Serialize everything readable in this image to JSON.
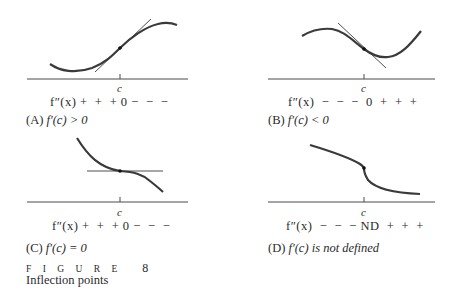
{
  "figure": {
    "number_label": "F I G U R E",
    "number": "8",
    "title": "Inflection points"
  },
  "panels": [
    {
      "id": "A",
      "tick_label": "c",
      "sign_chart": "f″(x) +  +  + 0 −  −  −",
      "caption_prefix": "(A) ",
      "caption": "f′(c) > 0",
      "tangent": "sloped-positive",
      "concavity_change": "up-to-down"
    },
    {
      "id": "B",
      "tick_label": "c",
      "sign_chart": "f″(x)  −  −  −  0  +  +  +",
      "caption_prefix": "(B) ",
      "caption": "f′(c) < 0",
      "tangent": "sloped-negative",
      "concavity_change": "down-to-up"
    },
    {
      "id": "C",
      "tick_label": "c",
      "sign_chart": "f″(x) +  +  + 0 −  −  −",
      "caption_prefix": "(C) ",
      "caption": "f′(c) = 0",
      "tangent": "horizontal",
      "concavity_change": "up-to-down"
    },
    {
      "id": "D",
      "tick_label": "c",
      "sign_chart": "f″(x)  −  −  − ND  +  +  +",
      "caption_prefix": "(D) ",
      "caption": "f′(c) is not defined",
      "tangent": "vertical",
      "concavity_change": "down-to-up"
    }
  ],
  "colors": {
    "curve": "#3a3a3a",
    "tangent": "#3a3a3a",
    "axis": "#4a4a4a",
    "text": "#2a2a2a"
  }
}
